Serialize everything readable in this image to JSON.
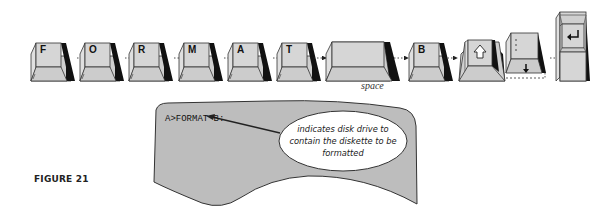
{
  "figure": {
    "label": "FIGURE 21"
  },
  "keys": [
    {
      "label": "F",
      "type": "letter"
    },
    {
      "label": "O",
      "type": "letter"
    },
    {
      "label": "R",
      "type": "letter"
    },
    {
      "label": "M",
      "type": "letter"
    },
    {
      "label": "A",
      "type": "letter"
    },
    {
      "label": "T",
      "type": "letter"
    },
    {
      "label": "",
      "type": "space",
      "caption": "space"
    },
    {
      "label": "B",
      "type": "letter"
    },
    {
      "label": "",
      "type": "shift-colon",
      "icons": [
        "shift-arrow-icon",
        "colon-icon"
      ]
    },
    {
      "label": "",
      "type": "enter",
      "icons": [
        "enter-arrow-icon"
      ]
    }
  ],
  "space_caption": "space",
  "screen": {
    "command": "A>FORMAT B:",
    "callout": "indicates disk drive to contain the diskette to be formatted"
  },
  "colors": {
    "key_face": "#d4d4d4",
    "key_side": "#111111",
    "screen_fill": "#bdbdbd",
    "outline": "#333333"
  }
}
